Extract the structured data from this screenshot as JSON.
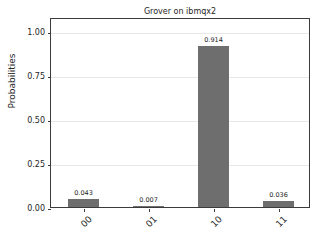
{
  "chart_data": {
    "type": "bar",
    "title": "Grover on ibmqx2",
    "xlabel": "",
    "ylabel": "Probabilities",
    "categories": [
      "00",
      "01",
      "10",
      "11"
    ],
    "values": [
      0.043,
      0.007,
      0.914,
      0.036
    ],
    "value_labels": [
      "0.043",
      "0.007",
      "0.914",
      "0.036"
    ],
    "ylim": [
      0.0,
      1.08
    ],
    "yticks": [
      0.0,
      0.25,
      0.5,
      0.75,
      1.0
    ],
    "ytick_labels": [
      "0.00",
      "0.25",
      "0.50",
      "0.75",
      "1.00"
    ],
    "grid": "horizontal",
    "legend": "none",
    "bar_color": "#6e6e6e",
    "grid_color": "#e8e8e8",
    "axes_color": "#3b3b3b",
    "background_color": "#ffffff",
    "xtick_rotation": -45
  }
}
